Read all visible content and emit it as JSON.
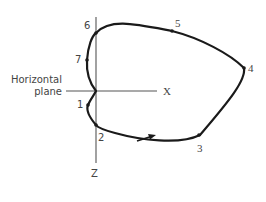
{
  "diagram": {
    "plane_label_line1": "Horizontal",
    "plane_label_line2": "plane",
    "x_axis_label": "X",
    "z_axis_label": "Z",
    "points": [
      {
        "id": "1",
        "label": "1"
      },
      {
        "id": "2",
        "label": "2"
      },
      {
        "id": "3",
        "label": "3"
      },
      {
        "id": "4",
        "label": "4"
      },
      {
        "id": "5",
        "label": "5"
      },
      {
        "id": "6",
        "label": "6"
      },
      {
        "id": "7",
        "label": "7"
      }
    ],
    "direction_arrow": "arrow-right-icon",
    "colors": {
      "curve": "#1a1a1a",
      "axes": "#555555",
      "text": "#444444"
    }
  }
}
